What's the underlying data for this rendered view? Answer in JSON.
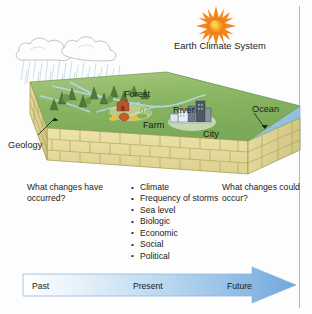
{
  "figure": {
    "title": "Earth Climate System",
    "bottom_caption": ""
  },
  "diagram": {
    "labels": [
      {
        "key": "forest",
        "text": "Forest"
      },
      {
        "key": "river",
        "text": "River"
      },
      {
        "key": "ocean",
        "text": "Ocean"
      },
      {
        "key": "farm",
        "text": "Farm"
      },
      {
        "key": "city",
        "text": "City"
      },
      {
        "key": "geology",
        "text": "Geology"
      }
    ],
    "forest": "Forest",
    "river": "River",
    "ocean": "Ocean",
    "farm": "Farm",
    "city": "City",
    "geology": "Geology",
    "sun": "sun-icon",
    "clouds": "cloud-icon",
    "rain": "rain-icon"
  },
  "questions": {
    "left": "What changes have occurred?",
    "right": "What changes could occur?"
  },
  "change_list": [
    "Climate",
    "Frequency of storms",
    "Sea level",
    "Biologic",
    "Economic",
    "Social",
    "Political"
  ],
  "timeline": {
    "past": "Past",
    "present": "Present",
    "future": "Future"
  },
  "colors": {
    "sun": "#F07E1E",
    "sun_core": "#FBC02D",
    "ocean": "#A9CEE8",
    "land_green": "#8FB96A",
    "rock_tan": "#E3DA9A",
    "rock_outline": "#9E9646",
    "arrow_start": "#FFFFFF",
    "arrow_end": "#6FA8DC",
    "text": "#1C1C1C",
    "rule": "#B8B8B8"
  }
}
